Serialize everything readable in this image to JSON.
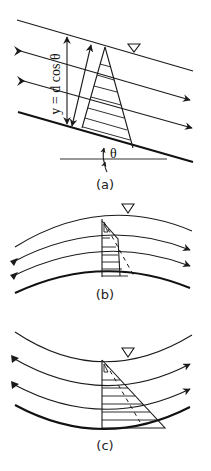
{
  "figure": {
    "panels": [
      {
        "id": "a",
        "label": "(a)",
        "description": "Flow down a uniform slope with linear (hydrostatic) pressure distribution",
        "depth_label": "y = d cos θ",
        "angle_label": "θ",
        "surface_symbol": "▽"
      },
      {
        "id": "b",
        "label": "(b)",
        "description": "Convex curvilinear flow with reduced pressure distribution",
        "surface_symbol": "▽"
      },
      {
        "id": "c",
        "label": "(c)",
        "description": "Concave curvilinear flow with increased pressure distribution",
        "surface_symbol": "▽"
      }
    ],
    "colors": {
      "line": "#1a1a1a",
      "background": "#ffffff"
    }
  }
}
